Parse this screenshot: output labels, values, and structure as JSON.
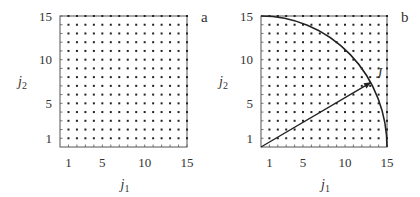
{
  "chart_data": [
    {
      "type": "scatter",
      "panel_label": "a",
      "description": "Integer lattice of (j1, j2) points, j1 and j2 each from 1 to 15",
      "x": [
        1,
        2,
        3,
        4,
        5,
        6,
        7,
        8,
        9,
        10,
        11,
        12,
        13,
        14,
        15
      ],
      "y": [
        1,
        2,
        3,
        4,
        5,
        6,
        7,
        8,
        9,
        10,
        11,
        12,
        13,
        14,
        15
      ],
      "xlabel": "j1",
      "ylabel": "j2",
      "xticks": [
        "1",
        "5",
        "10",
        "15"
      ],
      "yticks": [
        "1",
        "5",
        "10",
        "15"
      ],
      "xlim": [
        0,
        15
      ],
      "ylim": [
        0,
        15
      ],
      "grid": false
    },
    {
      "type": "scatter",
      "panel_label": "b",
      "description": "Same integer lattice with quarter-circle of radius 15 centered at origin and vector J from origin to the arc",
      "x": [
        1,
        2,
        3,
        4,
        5,
        6,
        7,
        8,
        9,
        10,
        11,
        12,
        13,
        14,
        15
      ],
      "y": [
        1,
        2,
        3,
        4,
        5,
        6,
        7,
        8,
        9,
        10,
        11,
        12,
        13,
        14,
        15
      ],
      "arc": {
        "center": [
          0,
          0
        ],
        "radius": 15,
        "from_deg": 0,
        "to_deg": 90
      },
      "vector": {
        "label": "J",
        "from": [
          0,
          0
        ],
        "to": [
          13.1,
          7.4
        ]
      },
      "xlabel": "j1",
      "ylabel": "j2",
      "xticks": [
        "1",
        "5",
        "10",
        "15"
      ],
      "yticks": [
        "1",
        "5",
        "10",
        "15"
      ],
      "xlim": [
        0,
        15
      ],
      "ylim": [
        0,
        15
      ],
      "grid": false
    }
  ],
  "panels": [
    {
      "label": "a",
      "xlabel_main": "j",
      "xlabel_sub": "1",
      "ylabel_main": "j",
      "ylabel_sub": "2",
      "ticks": [
        "1",
        "5",
        "10",
        "15"
      ]
    },
    {
      "label": "b",
      "xlabel_main": "j",
      "xlabel_sub": "1",
      "ylabel_main": "j",
      "ylabel_sub": "2",
      "ticks": [
        "1",
        "5",
        "10",
        "15"
      ],
      "vector_label": "J"
    }
  ]
}
